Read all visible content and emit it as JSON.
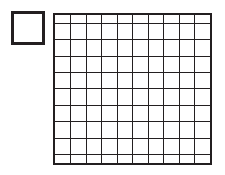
{
  "figure": {
    "background_color": "#ffffff",
    "line_color": "#231f20",
    "cell_fill_color": "#ffffff"
  },
  "unit_square": {
    "label": "unit-square",
    "x": 11,
    "y": 11,
    "width": 34,
    "height": 34,
    "border_width": 3,
    "border_color": "#231f20",
    "fill": "#ffffff",
    "value": 1
  },
  "hundred_grid": {
    "label": "hundred-square",
    "x": 53,
    "y": 13,
    "width": 159,
    "height": 152,
    "rows": 10,
    "columns": 10,
    "cells": 100,
    "outer_border_width": 2,
    "inner_line_width": 1,
    "line_color": "#231f20",
    "cell_fill": "#ffffff",
    "value": 100
  },
  "chart_data": {
    "type": "table",
    "xlabel": "",
    "ylabel": "",
    "categories": [
      "unit-square",
      "hundred-square"
    ],
    "values": [
      1,
      100
    ],
    "series": [
      {
        "name": "blocks",
        "values": [
          1,
          100
        ]
      }
    ],
    "grid": true,
    "legend_position": "none",
    "annotations": [
      "Small square = 1 unit",
      "Large square = 10 rows x 10 columns = 100 units"
    ]
  }
}
